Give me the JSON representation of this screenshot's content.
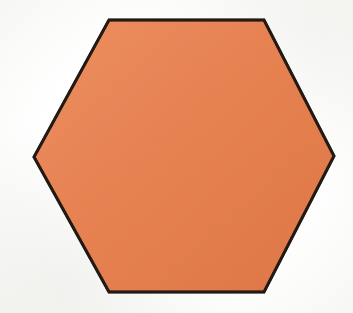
{
  "image": {
    "width": 353,
    "height": 313,
    "background_color": "#fdfdfc",
    "description": "Scanned illustration of a single orange hexagon on white paper"
  },
  "shape": {
    "name": "hexagon",
    "sides": 6,
    "orientation": "flat-top",
    "fill_color": "#e8804f",
    "fill_color_light": "#ee8e5e",
    "fill_color_dark": "#df7542",
    "stroke_color": "#231a14",
    "stroke_width": 3,
    "vertices": [
      {
        "label": "left",
        "x": 34,
        "y": 157
      },
      {
        "label": "top-left",
        "x": 109,
        "y": 20
      },
      {
        "label": "top-right",
        "x": 264,
        "y": 20
      },
      {
        "label": "right",
        "x": 334,
        "y": 156
      },
      {
        "label": "bottom-right",
        "x": 264,
        "y": 292
      },
      {
        "label": "bottom-left",
        "x": 109,
        "y": 292
      }
    ],
    "points_string": "34,157 109,20 264,20 334,156 264,292 109,292",
    "bounding_box": {
      "x": 34,
      "y": 19,
      "width": 300,
      "height": 274
    },
    "center": {
      "x": 184,
      "y": 156
    }
  }
}
